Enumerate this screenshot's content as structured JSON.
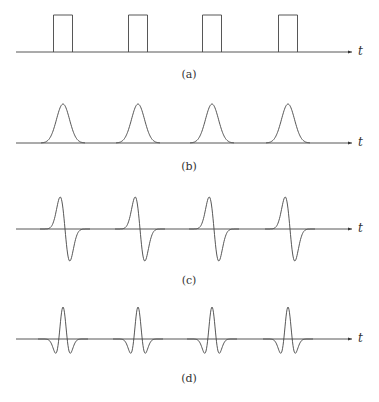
{
  "figure": {
    "panels": [
      {
        "label": "(a)",
        "axis_label": "t",
        "shape": "rectangular pulse train"
      },
      {
        "label": "(b)",
        "axis_label": "t",
        "shape": "gaussian pulse train"
      },
      {
        "label": "(c)",
        "axis_label": "t",
        "shape": "first derivative of gaussian pulse train"
      },
      {
        "label": "(d)",
        "axis_label": "t",
        "shape": "second derivative (mexican hat) pulse train"
      }
    ],
    "pulse_centers_x": [
      63,
      138,
      212,
      288
    ],
    "line_color": "#444444"
  }
}
